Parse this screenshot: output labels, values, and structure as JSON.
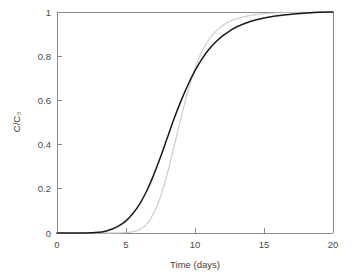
{
  "chart_data": {
    "type": "line",
    "title": "",
    "xlabel": "Time (days)",
    "ylabel": "C/C₀",
    "xlim": [
      0,
      20
    ],
    "ylim": [
      0,
      1
    ],
    "xticks": [
      0,
      5,
      10,
      15,
      20
    ],
    "xtick_labels": [
      "0",
      "5",
      "10",
      "15",
      "20"
    ],
    "yticks": [
      0,
      0.2,
      0.4,
      0.6,
      0.8,
      1
    ],
    "ytick_labels": [
      "0",
      "0.2",
      "0.4",
      "0.6",
      "0.8",
      "1"
    ],
    "grid": false,
    "legend": "none",
    "series": [
      {
        "name": "solid-curve",
        "style": "solid",
        "color": "#1a1a1a",
        "x": [
          0,
          1,
          2,
          3,
          3.5,
          4,
          4.5,
          5,
          5.5,
          6,
          6.5,
          7,
          7.5,
          8,
          8.5,
          9,
          9.5,
          10,
          10.5,
          11,
          11.5,
          12,
          12.5,
          13,
          14,
          15,
          16,
          17,
          18,
          19,
          20
        ],
        "y": [
          0,
          0,
          0,
          0.003,
          0.008,
          0.018,
          0.033,
          0.055,
          0.088,
          0.132,
          0.19,
          0.262,
          0.344,
          0.432,
          0.52,
          0.6,
          0.672,
          0.735,
          0.787,
          0.83,
          0.864,
          0.892,
          0.914,
          0.932,
          0.957,
          0.973,
          0.983,
          0.99,
          0.995,
          0.999,
          1.0
        ]
      },
      {
        "name": "dotted-curve",
        "style": "dotted",
        "color": "#c9c9c9",
        "x": [
          0,
          1,
          2,
          3,
          4,
          5,
          5.5,
          6,
          6.5,
          7,
          7.5,
          8,
          8.5,
          9,
          9.5,
          10,
          10.5,
          11,
          11.5,
          12,
          12.5,
          13,
          14,
          15,
          16,
          17,
          18,
          19,
          20
        ],
        "y": [
          0,
          0,
          0,
          0,
          0,
          0.002,
          0.006,
          0.016,
          0.04,
          0.09,
          0.165,
          0.27,
          0.395,
          0.525,
          0.645,
          0.745,
          0.82,
          0.874,
          0.912,
          0.938,
          0.956,
          0.969,
          0.984,
          0.992,
          0.996,
          0.998,
          0.999,
          1.0,
          1.0
        ]
      }
    ]
  }
}
